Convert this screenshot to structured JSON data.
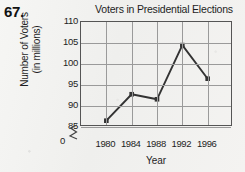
{
  "problem": {
    "number": "67."
  },
  "chart_data": {
    "type": "line",
    "title": "Voters in Presidential Elections",
    "xlabel": "Year",
    "ylabel_line1": "Number of Voters",
    "ylabel_line2": "(in millions)",
    "categories": [
      "1980",
      "1984",
      "1988",
      "1992",
      "1996"
    ],
    "values": [
      86.5,
      92.8,
      91.6,
      104.5,
      96.5
    ],
    "ytick_labels": [
      "110",
      "105",
      "100",
      "95",
      "90",
      "85"
    ],
    "ytick_values": [
      110,
      105,
      100,
      95,
      90,
      85
    ],
    "zero_label": "0",
    "ylim": [
      85,
      110
    ],
    "axis_break": true,
    "grid": true,
    "legend": "none",
    "series_color": "#333333",
    "grid_color": "#9a9a9a",
    "axis_color": "#555555"
  }
}
